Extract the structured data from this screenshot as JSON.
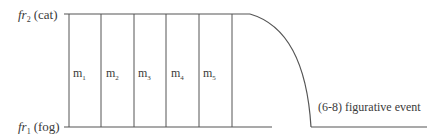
{
  "diagram": {
    "top_label": {
      "main": "fr",
      "sub": "2",
      "tail": "(cat)"
    },
    "bottom_label": {
      "main": "fr",
      "sub": "1",
      "tail": "(fog)"
    },
    "segments": [
      {
        "main": "m",
        "sub": "1"
      },
      {
        "main": "m",
        "sub": "2"
      },
      {
        "main": "m",
        "sub": "3"
      },
      {
        "main": "m",
        "sub": "4"
      },
      {
        "main": "m",
        "sub": "5"
      }
    ],
    "event_label": "(6-8) figurative event",
    "line_color": "#555555"
  }
}
